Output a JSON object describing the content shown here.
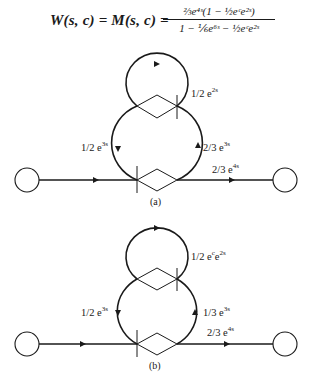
{
  "formula": {
    "lhs": "W(s, c) = M(s, c) =",
    "numerator": "⅔e⁴ˢ(1 − ½eᶜe²ˢ)",
    "denominator": "1 − ⅙e⁶ˢ − ½eᶜe²ˢ",
    "latex": "W(s,c) = M(s,c) = \\frac{\\frac{2}{3}e^{4s}(1 - \\frac{1}{2}e^{c}e^{2s})}{1 - \\frac{1}{6}e^{6s} - \\frac{1}{2}e^{c}e^{2s}}"
  },
  "diagrams": [
    {
      "caption": "(a)",
      "self_loop_label": {
        "coef": "1/2 e",
        "exp": "2s"
      },
      "left_branch_label": {
        "coef": "1/2 e",
        "exp": "3s"
      },
      "right_branch_label": {
        "coef": "2/3 e",
        "exp": "3s"
      },
      "output_label": {
        "coef": "2/3 e",
        "exp": "4s"
      }
    },
    {
      "caption": "(b)",
      "self_loop_label": {
        "coef": "1/2 e",
        "mid": "c",
        "coef2": "e",
        "exp": "2s"
      },
      "left_branch_label": {
        "coef": "1/2 e",
        "exp": "3s"
      },
      "right_branch_label": {
        "coef": "1/3 e",
        "exp": "3s"
      },
      "output_label": {
        "coef": "2/3 e",
        "exp": "4s"
      }
    }
  ],
  "colors": {
    "ink": "#1a1a1a",
    "background": "#ffffff"
  }
}
